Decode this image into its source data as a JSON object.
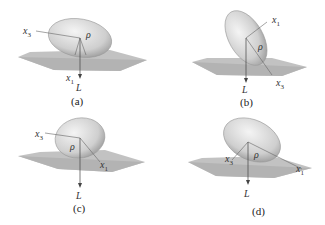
{
  "figure": {
    "panels": [
      {
        "id": "a",
        "caption": "(a)",
        "labels": {
          "x3": "x",
          "x3_sub": "3",
          "x1": "x",
          "x1_sub": "1",
          "rho": "ρ⃗",
          "L": "L⃗"
        }
      },
      {
        "id": "b",
        "caption": "(b)",
        "labels": {
          "x1": "x",
          "x1_sub": "1",
          "x3": "x",
          "x3_sub": "3",
          "rho": "ρ⃗",
          "L": "L⃗"
        }
      },
      {
        "id": "c",
        "caption": "(c)",
        "labels": {
          "x3": "x",
          "x3_sub": "3",
          "x1": "x",
          "x1_sub": "1",
          "rho": "ρ⃗",
          "L": "L⃗"
        }
      },
      {
        "id": "d",
        "caption": "(d)",
        "labels": {
          "x3": "x",
          "x3_sub": "3",
          "x1": "x",
          "x1_sub": "1",
          "rho": "ρ⃗",
          "L": "L⃗"
        }
      }
    ],
    "colors": {
      "ellipsoid_fill": "#d9d9d9",
      "ellipsoid_edge": "#9a9a9a",
      "plane": "#a9a9a9",
      "axis": "#555555"
    }
  }
}
